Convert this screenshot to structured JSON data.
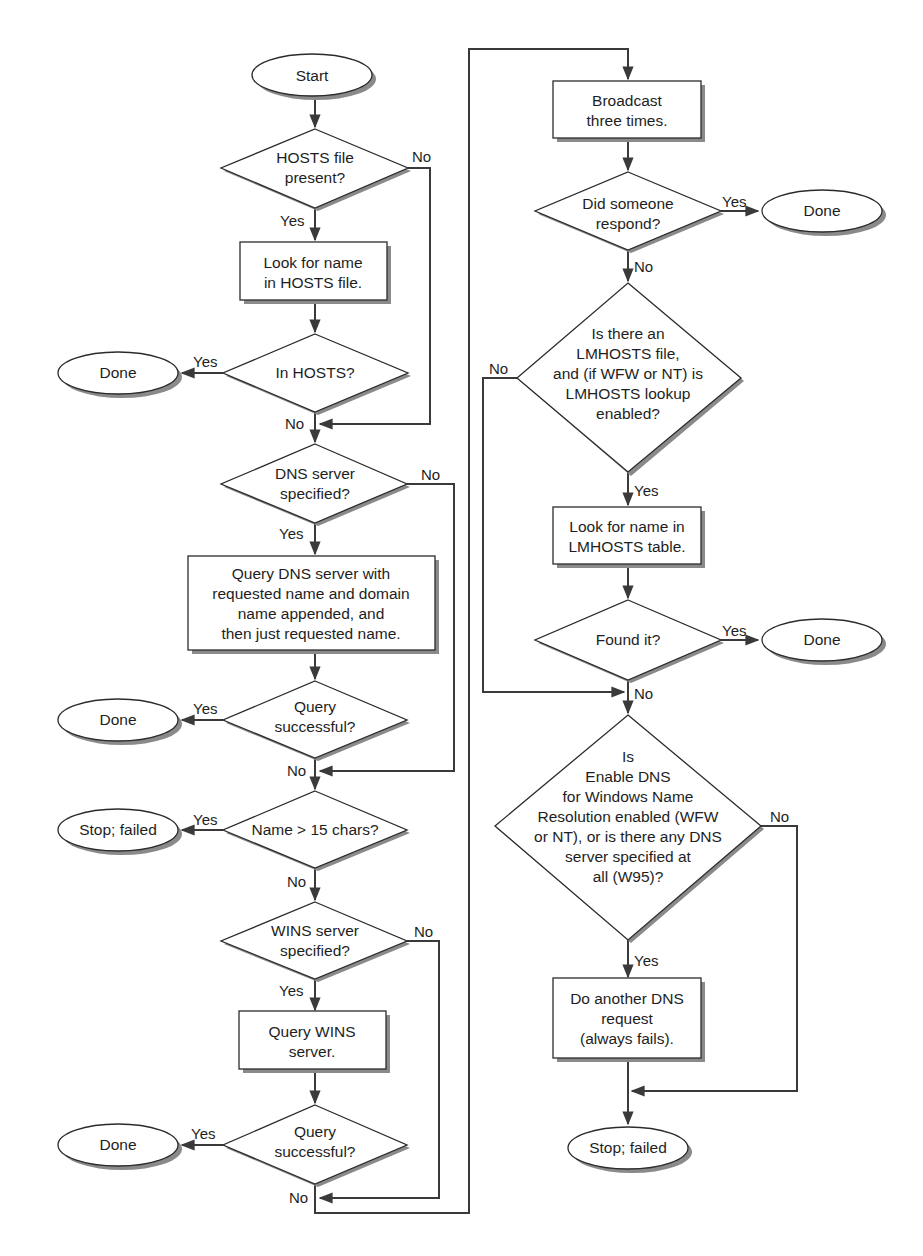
{
  "diagram": {
    "type": "flowchart",
    "nodes": [
      {
        "id": "start",
        "kind": "terminal",
        "lines": [
          "Start"
        ]
      },
      {
        "id": "d_hosts_present",
        "kind": "decision",
        "lines": [
          "HOSTS file",
          "present?"
        ]
      },
      {
        "id": "p_lookup_hosts",
        "kind": "process",
        "lines": [
          "Look for name",
          "in HOSTS file."
        ]
      },
      {
        "id": "d_in_hosts",
        "kind": "decision",
        "lines": [
          "In HOSTS?"
        ]
      },
      {
        "id": "t_done_1",
        "kind": "terminal",
        "lines": [
          "Done"
        ]
      },
      {
        "id": "d_dns_specified",
        "kind": "decision",
        "lines": [
          "DNS server",
          "specified?"
        ]
      },
      {
        "id": "p_query_dns",
        "kind": "process",
        "lines": [
          "Query DNS server with",
          "requested name and domain",
          "name appended, and",
          "then just requested name."
        ]
      },
      {
        "id": "d_dns_success",
        "kind": "decision",
        "lines": [
          "Query",
          "successful?"
        ]
      },
      {
        "id": "t_done_2",
        "kind": "terminal",
        "lines": [
          "Done"
        ]
      },
      {
        "id": "d_name_len",
        "kind": "decision",
        "lines": [
          "Name > 15 chars?"
        ]
      },
      {
        "id": "t_stop_1",
        "kind": "terminal",
        "lines": [
          "Stop; failed"
        ]
      },
      {
        "id": "d_wins_specified",
        "kind": "decision",
        "lines": [
          "WINS server",
          "specified?"
        ]
      },
      {
        "id": "p_query_wins",
        "kind": "process",
        "lines": [
          "Query WINS",
          "server."
        ]
      },
      {
        "id": "d_wins_success",
        "kind": "decision",
        "lines": [
          "Query",
          "successful?"
        ]
      },
      {
        "id": "t_done_3",
        "kind": "terminal",
        "lines": [
          "Done"
        ]
      },
      {
        "id": "p_broadcast",
        "kind": "process",
        "lines": [
          "Broadcast",
          "three times."
        ]
      },
      {
        "id": "d_respond",
        "kind": "decision",
        "lines": [
          "Did someone",
          "respond?"
        ]
      },
      {
        "id": "t_done_4",
        "kind": "terminal",
        "lines": [
          "Done"
        ]
      },
      {
        "id": "d_lmhosts",
        "kind": "decision",
        "lines": [
          "Is there an",
          "LMHOSTS file,",
          "and (if WFW or NT) is",
          "LMHOSTS lookup",
          "enabled?"
        ]
      },
      {
        "id": "p_lookup_lmhosts",
        "kind": "process",
        "lines": [
          "Look for name in",
          "LMHOSTS table."
        ]
      },
      {
        "id": "d_found",
        "kind": "decision",
        "lines": [
          "Found it?"
        ]
      },
      {
        "id": "t_done_5",
        "kind": "terminal",
        "lines": [
          "Done"
        ]
      },
      {
        "id": "d_enable_dns",
        "kind": "decision",
        "lines": [
          "Is",
          "Enable DNS",
          "for Windows Name",
          "Resolution enabled (WFW",
          "or NT), or is there any DNS",
          "server specified at",
          "all (W95)?"
        ]
      },
      {
        "id": "p_another_dns",
        "kind": "process",
        "lines": [
          "Do another DNS",
          "request",
          "(always fails)."
        ]
      },
      {
        "id": "t_stop_2",
        "kind": "terminal",
        "lines": [
          "Stop; failed"
        ]
      }
    ],
    "edge_labels": {
      "yes": "Yes",
      "no": "No"
    },
    "edges": [
      {
        "from": "start",
        "to": "d_hosts_present"
      },
      {
        "from": "d_hosts_present",
        "to": "p_lookup_hosts",
        "label": "Yes"
      },
      {
        "from": "d_hosts_present",
        "to": "d_dns_specified",
        "label": "No"
      },
      {
        "from": "p_lookup_hosts",
        "to": "d_in_hosts"
      },
      {
        "from": "d_in_hosts",
        "to": "t_done_1",
        "label": "Yes"
      },
      {
        "from": "d_in_hosts",
        "to": "d_dns_specified",
        "label": "No"
      },
      {
        "from": "d_dns_specified",
        "to": "p_query_dns",
        "label": "Yes"
      },
      {
        "from": "d_dns_specified",
        "to": "d_name_len",
        "label": "No"
      },
      {
        "from": "p_query_dns",
        "to": "d_dns_success"
      },
      {
        "from": "d_dns_success",
        "to": "t_done_2",
        "label": "Yes"
      },
      {
        "from": "d_dns_success",
        "to": "d_name_len",
        "label": "No"
      },
      {
        "from": "d_name_len",
        "to": "t_stop_1",
        "label": "Yes"
      },
      {
        "from": "d_name_len",
        "to": "d_wins_specified",
        "label": "No"
      },
      {
        "from": "d_wins_specified",
        "to": "p_query_wins",
        "label": "Yes"
      },
      {
        "from": "d_wins_specified",
        "to": "p_broadcast",
        "label": "No"
      },
      {
        "from": "p_query_wins",
        "to": "d_wins_success"
      },
      {
        "from": "d_wins_success",
        "to": "t_done_3",
        "label": "Yes"
      },
      {
        "from": "d_wins_success",
        "to": "p_broadcast",
        "label": "No"
      },
      {
        "from": "p_broadcast",
        "to": "d_respond"
      },
      {
        "from": "d_respond",
        "to": "t_done_4",
        "label": "Yes"
      },
      {
        "from": "d_respond",
        "to": "d_lmhosts",
        "label": "No"
      },
      {
        "from": "d_lmhosts",
        "to": "p_lookup_lmhosts",
        "label": "Yes"
      },
      {
        "from": "d_lmhosts",
        "to": "d_enable_dns",
        "label": "No"
      },
      {
        "from": "p_lookup_lmhosts",
        "to": "d_found"
      },
      {
        "from": "d_found",
        "to": "t_done_5",
        "label": "Yes"
      },
      {
        "from": "d_found",
        "to": "d_enable_dns",
        "label": "No"
      },
      {
        "from": "d_enable_dns",
        "to": "p_another_dns",
        "label": "Yes"
      },
      {
        "from": "d_enable_dns",
        "to": "t_stop_2",
        "label": "No"
      },
      {
        "from": "p_another_dns",
        "to": "t_stop_2"
      }
    ]
  },
  "colors": {
    "stroke": "#2b2b2b",
    "fill": "#ffffff",
    "shadow": "#8a8a8a",
    "text": "#1e1e1e"
  }
}
